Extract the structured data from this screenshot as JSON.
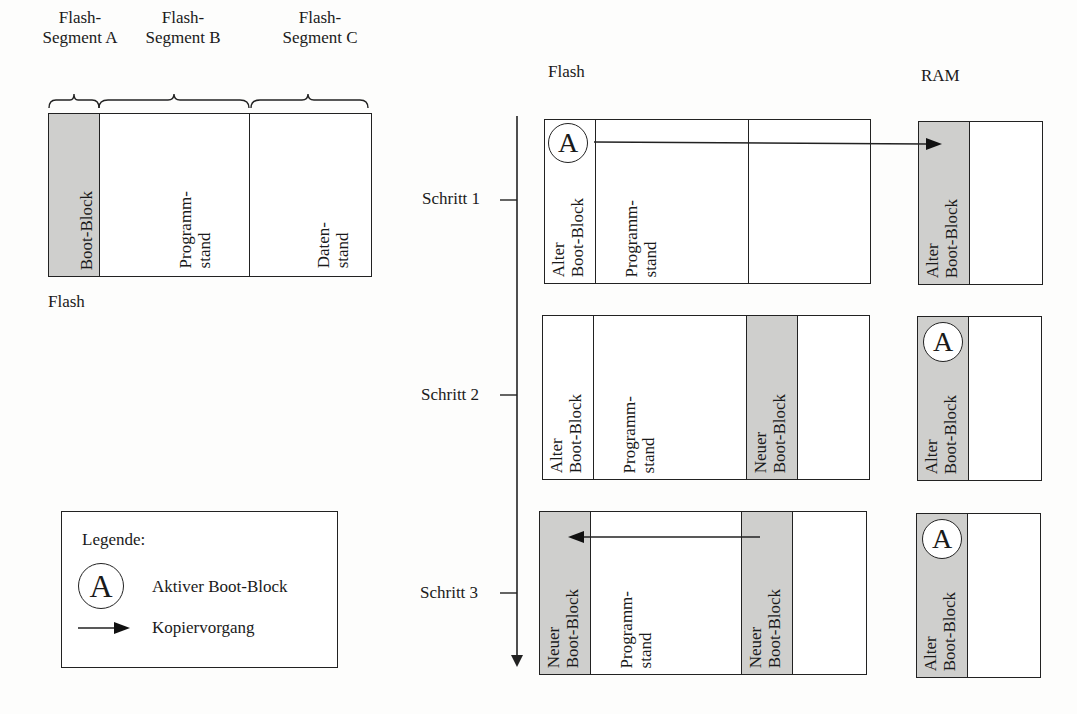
{
  "left_diagram": {
    "segment_labels": [
      {
        "line1": "Flash-",
        "line2": "Segment A"
      },
      {
        "line1": "Flash-",
        "line2": "Segment B"
      },
      {
        "line1": "Flash-",
        "line2": "Segment C"
      }
    ],
    "cells": {
      "boot_block": "Boot-Block",
      "programm_l1": "Programm-",
      "programm_l2": "stand",
      "daten_l1": "Daten-",
      "daten_l2": "stand"
    },
    "caption": "Flash"
  },
  "right_diagram": {
    "flash_header": "Flash",
    "ram_header": "RAM",
    "steps": [
      {
        "label": "Schritt 1",
        "flash": {
          "boot_block": {
            "l1": "Alter",
            "l2": "Boot-Block",
            "shaded": false,
            "active": true
          },
          "programm": {
            "l1": "Programm-",
            "l2": "stand"
          },
          "segment_c": {
            "l1": "",
            "l2": "",
            "shaded": false
          }
        },
        "ram": {
          "l1": "Alter",
          "l2": "Boot-Block",
          "active": false
        },
        "copy": "Flash Segment A -> RAM"
      },
      {
        "label": "Schritt 2",
        "flash": {
          "boot_block": {
            "l1": "Alter",
            "l2": "Boot-Block",
            "shaded": false,
            "active": false
          },
          "programm": {
            "l1": "Programm-",
            "l2": "stand"
          },
          "segment_c": {
            "l1": "Neuer",
            "l2": "Boot-Block",
            "shaded": true
          }
        },
        "ram": {
          "l1": "Alter",
          "l2": "Boot-Block",
          "active": true
        }
      },
      {
        "label": "Schritt 3",
        "flash": {
          "boot_block": {
            "l1": "Neuer",
            "l2": "Boot-Block",
            "shaded": true,
            "active": false
          },
          "programm": {
            "l1": "Programm-",
            "l2": "stand"
          },
          "segment_c": {
            "l1": "Neuer",
            "l2": "Boot-Block",
            "shaded": true
          }
        },
        "ram": {
          "l1": "Alter",
          "l2": "Boot-Block",
          "active": true
        },
        "copy": "Flash Segment C -> Flash Segment A"
      }
    ],
    "active_marker": "A"
  },
  "legend": {
    "title": "Legende:",
    "items": [
      {
        "icon": "circle-a-icon",
        "marker": "A",
        "label": "Aktiver Boot-Block"
      },
      {
        "icon": "arrow-right-icon",
        "label": "Kopiervorgang"
      }
    ]
  },
  "colors": {
    "shade": "#cfcfcd",
    "line": "#222222",
    "background": "#fdfdfc"
  }
}
